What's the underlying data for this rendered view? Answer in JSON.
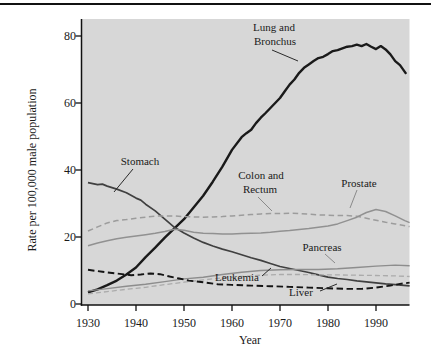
{
  "figure_title": "Cancer death rate trends line chart",
  "chart_data": {
    "type": "line",
    "title": "",
    "xlabel": "Year",
    "ylabel": "Rate per 100,000 male population",
    "xlim": [
      1930,
      1997
    ],
    "ylim": [
      0,
      85
    ],
    "grid": false,
    "legend": "none (direct line annotations with callout lines)",
    "plot_background": "#d7d7d7",
    "x_tick_labels": [
      "1930",
      "1940",
      "1950",
      "1960",
      "1970",
      "1980",
      "1990"
    ],
    "y_tick_labels": [
      "0",
      "20",
      "40",
      "60",
      "80"
    ],
    "labels": {
      "lung1": "Lung and",
      "lung2": "Bronchus",
      "stomach": "Stomach",
      "colon1": "Colon and",
      "colon2": "Rectum",
      "prostate": "Prostate",
      "pancreas": "Pancreas",
      "leukemia": "Leukemia",
      "liver": "Liver"
    },
    "series": [
      {
        "name": "Lung and Bronchus",
        "style": "solid",
        "color": "#1a1a1a",
        "width": 2.4,
        "points": [
          [
            1930,
            3.5
          ],
          [
            1932,
            4.4
          ],
          [
            1934,
            5.6
          ],
          [
            1936,
            7.0
          ],
          [
            1938,
            8.8
          ],
          [
            1940,
            10.9
          ],
          [
            1942,
            14.0
          ],
          [
            1944,
            16.8
          ],
          [
            1946,
            19.8
          ],
          [
            1948,
            22.6
          ],
          [
            1950,
            25.3
          ],
          [
            1952,
            28.8
          ],
          [
            1954,
            32.3
          ],
          [
            1956,
            36.5
          ],
          [
            1958,
            41.0
          ],
          [
            1960,
            46.0
          ],
          [
            1962,
            49.8
          ],
          [
            1963,
            51.0
          ],
          [
            1964,
            52.0
          ],
          [
            1965,
            54.0
          ],
          [
            1966,
            55.6
          ],
          [
            1967,
            57.0
          ],
          [
            1968,
            58.5
          ],
          [
            1969,
            60.0
          ],
          [
            1970,
            61.5
          ],
          [
            1971,
            63.5
          ],
          [
            1972,
            65.5
          ],
          [
            1973,
            67.0
          ],
          [
            1974,
            69.0
          ],
          [
            1975,
            70.5
          ],
          [
            1976,
            71.5
          ],
          [
            1977,
            72.5
          ],
          [
            1978,
            73.4
          ],
          [
            1979,
            73.8
          ],
          [
            1980,
            74.6
          ],
          [
            1981,
            75.5
          ],
          [
            1982,
            75.8
          ],
          [
            1983,
            76.3
          ],
          [
            1984,
            76.8
          ],
          [
            1985,
            77.0
          ],
          [
            1986,
            77.4
          ],
          [
            1987,
            77.0
          ],
          [
            1988,
            77.6
          ],
          [
            1989,
            76.8
          ],
          [
            1990,
            76.1
          ],
          [
            1991,
            77.0
          ],
          [
            1992,
            76.0
          ],
          [
            1993,
            74.5
          ],
          [
            1994,
            72.5
          ],
          [
            1995,
            71.3
          ],
          [
            1996.3,
            68.7
          ]
        ]
      },
      {
        "name": "Stomach",
        "style": "solid",
        "color": "#404040",
        "width": 1.7,
        "points": [
          [
            1930,
            36.2
          ],
          [
            1932,
            35.6
          ],
          [
            1933,
            35.8
          ],
          [
            1934,
            35.2
          ],
          [
            1936,
            34.3
          ],
          [
            1938,
            33.2
          ],
          [
            1940,
            31.6
          ],
          [
            1941,
            31.0
          ],
          [
            1942,
            29.8
          ],
          [
            1944,
            27.8
          ],
          [
            1946,
            25.3
          ],
          [
            1948,
            22.9
          ],
          [
            1950,
            21.2
          ],
          [
            1952,
            19.7
          ],
          [
            1954,
            18.4
          ],
          [
            1956,
            17.3
          ],
          [
            1958,
            16.4
          ],
          [
            1960,
            15.6
          ],
          [
            1962,
            14.7
          ],
          [
            1964,
            13.8
          ],
          [
            1966,
            13.0
          ],
          [
            1968,
            12.1
          ],
          [
            1970,
            11.2
          ],
          [
            1972,
            10.6
          ],
          [
            1974,
            10.0
          ],
          [
            1976,
            9.4
          ],
          [
            1978,
            8.7
          ],
          [
            1980,
            8.0
          ],
          [
            1982,
            7.6
          ],
          [
            1984,
            7.3
          ],
          [
            1986,
            6.9
          ],
          [
            1988,
            6.6
          ],
          [
            1990,
            6.3
          ],
          [
            1992,
            6.0
          ],
          [
            1994,
            5.8
          ],
          [
            1997,
            5.4
          ]
        ]
      },
      {
        "name": "Colon and Rectum",
        "style": "dashed",
        "color": "#9c9c9c",
        "width": 1.5,
        "dash": "5.5,3.5",
        "points": [
          [
            1930,
            21.8
          ],
          [
            1932,
            23.0
          ],
          [
            1934,
            24.2
          ],
          [
            1936,
            24.9
          ],
          [
            1938,
            25.2
          ],
          [
            1940,
            25.6
          ],
          [
            1942,
            25.9
          ],
          [
            1944,
            26.2
          ],
          [
            1946,
            26.3
          ],
          [
            1948,
            26.3
          ],
          [
            1950,
            26.1
          ],
          [
            1952,
            26.0
          ],
          [
            1954,
            25.9
          ],
          [
            1956,
            26.0
          ],
          [
            1958,
            26.1
          ],
          [
            1960,
            26.3
          ],
          [
            1962,
            26.5
          ],
          [
            1964,
            26.7
          ],
          [
            1966,
            26.9
          ],
          [
            1968,
            27.0
          ],
          [
            1970,
            27.0
          ],
          [
            1972,
            27.1
          ],
          [
            1974,
            27.0
          ],
          [
            1976,
            26.8
          ],
          [
            1978,
            26.6
          ],
          [
            1980,
            26.5
          ],
          [
            1982,
            26.4
          ],
          [
            1984,
            26.4
          ],
          [
            1986,
            26.2
          ],
          [
            1988,
            25.6
          ],
          [
            1990,
            25.0
          ],
          [
            1992,
            24.4
          ],
          [
            1994,
            23.9
          ],
          [
            1997,
            23.1
          ]
        ]
      },
      {
        "name": "Prostate",
        "style": "solid",
        "color": "#919191",
        "width": 1.5,
        "points": [
          [
            1930,
            17.4
          ],
          [
            1932,
            18.2
          ],
          [
            1934,
            18.9
          ],
          [
            1936,
            19.5
          ],
          [
            1938,
            19.9
          ],
          [
            1940,
            20.3
          ],
          [
            1942,
            20.7
          ],
          [
            1944,
            21.1
          ],
          [
            1946,
            21.6
          ],
          [
            1948,
            22.3
          ],
          [
            1950,
            22.0
          ],
          [
            1952,
            21.4
          ],
          [
            1954,
            21.1
          ],
          [
            1956,
            21.0
          ],
          [
            1958,
            20.9
          ],
          [
            1960,
            20.9
          ],
          [
            1962,
            21.0
          ],
          [
            1964,
            21.1
          ],
          [
            1966,
            21.2
          ],
          [
            1968,
            21.4
          ],
          [
            1970,
            21.7
          ],
          [
            1972,
            21.9
          ],
          [
            1974,
            22.2
          ],
          [
            1976,
            22.5
          ],
          [
            1978,
            22.9
          ],
          [
            1980,
            23.3
          ],
          [
            1982,
            23.9
          ],
          [
            1984,
            24.9
          ],
          [
            1986,
            25.9
          ],
          [
            1988,
            27.3
          ],
          [
            1990,
            28.2
          ],
          [
            1992,
            27.6
          ],
          [
            1994,
            26.3
          ],
          [
            1996,
            24.9
          ],
          [
            1997,
            24.3
          ]
        ]
      },
      {
        "name": "Pancreas",
        "style": "solid",
        "color": "#8d8d8d",
        "width": 1.4,
        "points": [
          [
            1930,
            3.9
          ],
          [
            1934,
            4.6
          ],
          [
            1938,
            5.3
          ],
          [
            1942,
            5.9
          ],
          [
            1946,
            6.7
          ],
          [
            1950,
            7.5
          ],
          [
            1954,
            8.0
          ],
          [
            1958,
            8.8
          ],
          [
            1962,
            9.5
          ],
          [
            1966,
            10.0
          ],
          [
            1970,
            10.2
          ],
          [
            1974,
            10.3
          ],
          [
            1978,
            10.3
          ],
          [
            1982,
            10.5
          ],
          [
            1986,
            10.9
          ],
          [
            1990,
            11.3
          ],
          [
            1994,
            11.6
          ],
          [
            1997,
            11.4
          ]
        ]
      },
      {
        "name": "Leukemia",
        "style": "dashed",
        "color": "#ababab",
        "width": 1.3,
        "dash": "5,3",
        "points": [
          [
            1930,
            3.0
          ],
          [
            1934,
            3.7
          ],
          [
            1938,
            4.4
          ],
          [
            1942,
            5.0
          ],
          [
            1946,
            5.8
          ],
          [
            1950,
            6.5
          ],
          [
            1954,
            7.2
          ],
          [
            1958,
            7.8
          ],
          [
            1962,
            8.2
          ],
          [
            1966,
            8.6
          ],
          [
            1970,
            8.8
          ],
          [
            1974,
            8.8
          ],
          [
            1978,
            8.7
          ],
          [
            1982,
            8.7
          ],
          [
            1986,
            8.6
          ],
          [
            1990,
            8.5
          ],
          [
            1994,
            8.4
          ],
          [
            1997,
            8.2
          ]
        ]
      },
      {
        "name": "Liver",
        "style": "dashed",
        "color": "#141414",
        "width": 1.9,
        "dash": "6.5,3.5",
        "points": [
          [
            1930,
            10.2
          ],
          [
            1933,
            9.6
          ],
          [
            1936,
            9.1
          ],
          [
            1939,
            8.6
          ],
          [
            1941,
            8.8
          ],
          [
            1943,
            9.1
          ],
          [
            1945,
            8.9
          ],
          [
            1947,
            8.2
          ],
          [
            1949,
            7.6
          ],
          [
            1951,
            7.0
          ],
          [
            1954,
            6.5
          ],
          [
            1957,
            5.9
          ],
          [
            1960,
            5.7
          ],
          [
            1964,
            5.5
          ],
          [
            1968,
            5.3
          ],
          [
            1972,
            5.1
          ],
          [
            1976,
            4.9
          ],
          [
            1980,
            4.7
          ],
          [
            1984,
            4.5
          ],
          [
            1987,
            4.5
          ],
          [
            1990,
            4.9
          ],
          [
            1993,
            5.5
          ],
          [
            1995,
            6.0
          ],
          [
            1997,
            6.4
          ]
        ]
      }
    ]
  }
}
